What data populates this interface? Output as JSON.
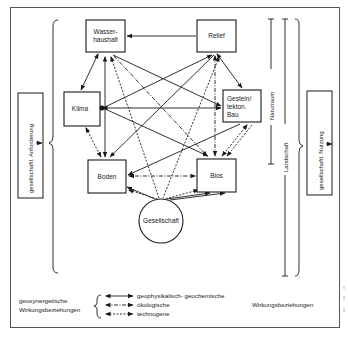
{
  "diagram": {
    "nodes": {
      "wasserhaushalt": {
        "line1": "Wasser-",
        "line2": "haushalt"
      },
      "relief": {
        "label": "Relief"
      },
      "klima": {
        "label": "Klima"
      },
      "gestein": {
        "line1": "Gestein/",
        "line2": "tekton.",
        "line3": "Bau"
      },
      "boden": {
        "label": "Boden"
      },
      "bios": {
        "label": "Bios"
      },
      "gesellschaft": {
        "label": "Gesellschaft"
      }
    },
    "left_box": {
      "label": "gesellschaftl. Anforderung"
    },
    "right_box": {
      "label": "gesellschaftl. Nutzung"
    },
    "scales": {
      "naturraum": "Naturraum",
      "landschaft": "Landschaft"
    },
    "edges": [
      {
        "from": "relief",
        "to": "wasserhaushalt",
        "type": "geophysikalisch-geochemisch"
      },
      {
        "from": "wasserhaushalt",
        "to": "klima",
        "type": "geophysikalisch-geochemisch"
      },
      {
        "from": "relief",
        "to": "gestein",
        "type": "geophysikalisch-geochemisch"
      },
      {
        "from": "klima",
        "to": "gestein",
        "type": "geophysikalisch-geochemisch"
      },
      {
        "from": "klima",
        "to": "relief",
        "type": "geophysikalisch-geochemisch"
      },
      {
        "from": "wasserhaushalt",
        "to": "gestein",
        "type": "geophysikalisch-geochemisch"
      },
      {
        "from": "klima",
        "to": "bios",
        "type": "geophysikalisch-geochemisch"
      },
      {
        "from": "wasserhaushalt",
        "to": "boden",
        "type": "geophysikalisch-geochemisch"
      },
      {
        "from": "relief",
        "to": "boden",
        "type": "geophysikalisch-geochemisch"
      },
      {
        "from": "gestein",
        "to": "boden",
        "type": "geophysikalisch-geochemisch"
      },
      {
        "from": "wasserhaushalt",
        "to": "bios",
        "type": "ökologisch"
      },
      {
        "from": "relief",
        "to": "bios",
        "type": "ökologisch"
      },
      {
        "from": "bios",
        "to": "boden",
        "type": "ökologisch"
      },
      {
        "from": "klima",
        "to": "boden",
        "type": "technogen"
      },
      {
        "from": "gestein",
        "to": "bios",
        "type": "technogen"
      },
      {
        "from": "gesellschaft",
        "to": "boden",
        "type": "geophysikalisch-geochemisch"
      },
      {
        "from": "gesellschaft",
        "to": "bios",
        "type": "geophysikalisch-geochemisch"
      },
      {
        "from": "gesellschaft",
        "to": "wasserhaushalt",
        "type": "technogen"
      },
      {
        "from": "gesellschaft",
        "to": "relief",
        "type": "technogen"
      }
    ]
  },
  "legend": {
    "left_line1": "geosynergetische",
    "left_line2": "Wirkungsbeziehungen",
    "items": [
      {
        "label": "geophysikalisch- geochemische",
        "style": "solid"
      },
      {
        "label": "ökologische",
        "style": "dash-dot"
      },
      {
        "label": "technogene",
        "style": "dashed"
      }
    ],
    "right_label": "Wirkungsbeziehungen"
  },
  "colors": {
    "ink": "#1a1a1a",
    "background": "#ffffff"
  }
}
